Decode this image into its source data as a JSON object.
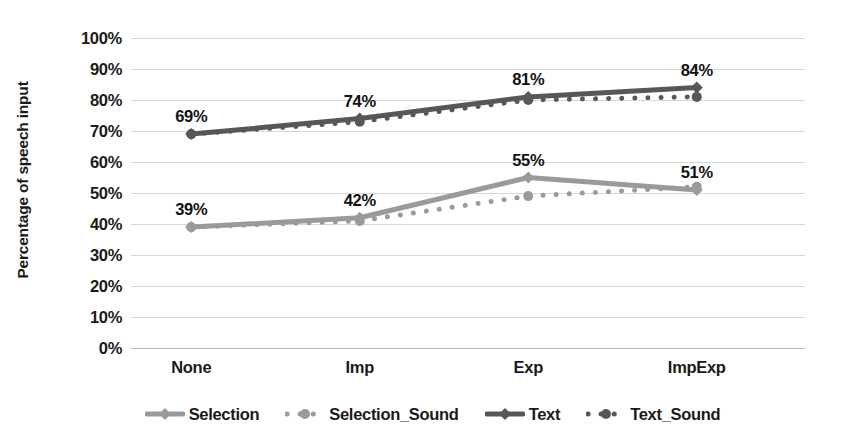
{
  "chart_data": {
    "type": "line",
    "title": "",
    "xlabel": "",
    "ylabel": "Percentage of speech input",
    "categories": [
      "None",
      "Imp",
      "Exp",
      "ImpExp"
    ],
    "ylim": [
      0,
      100
    ],
    "ytick_labels": [
      "100%",
      "90%",
      "80%",
      "70%",
      "60%",
      "50%",
      "40%",
      "30%",
      "20%",
      "10%",
      "0%"
    ],
    "ytick_values": [
      100,
      90,
      80,
      70,
      60,
      50,
      40,
      30,
      20,
      10,
      0
    ],
    "grid": true,
    "legend_position": "bottom",
    "series": [
      {
        "name": "Selection",
        "values": [
          39,
          42,
          55,
          51
        ],
        "color": "#9a9a9a",
        "style": "solid",
        "marker": "diamond",
        "labels": [
          "39%",
          "42%",
          "55%",
          "51%"
        ],
        "show_labels": true
      },
      {
        "name": "Selection_Sound",
        "values": [
          39,
          41,
          49,
          52
        ],
        "color": "#9a9a9a",
        "style": "dotted",
        "marker": "circle",
        "labels": [
          "",
          "",
          "",
          ""
        ],
        "show_labels": false
      },
      {
        "name": "Text",
        "values": [
          69,
          74,
          81,
          84
        ],
        "color": "#575757",
        "style": "solid",
        "marker": "diamond",
        "labels": [
          "69%",
          "74%",
          "81%",
          "84%"
        ],
        "show_labels": true
      },
      {
        "name": "Text_Sound",
        "values": [
          69,
          73,
          80,
          81
        ],
        "color": "#575757",
        "style": "dotted",
        "marker": "circle",
        "labels": [
          "",
          "",
          "",
          ""
        ],
        "show_labels": false
      }
    ],
    "colors": {
      "selection": "#9a9a9a",
      "text": "#575757",
      "gridline": "#d6d6d6",
      "axis": "#b9b9b9",
      "label_text": "#111111"
    }
  }
}
